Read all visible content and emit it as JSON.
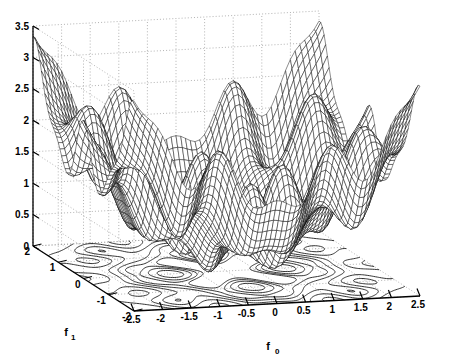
{
  "chart_data": {
    "type": "line",
    "render": "surface-mesh-3d-with-contour",
    "title": "",
    "subtitle": "",
    "xlabel": "f_0",
    "ylabel": "f_1",
    "zlabel": "",
    "axes": {
      "x": {
        "label": "f",
        "label_sub": "0",
        "min": -2.5,
        "max": 2.5,
        "ticks": [
          -2.5,
          -2,
          -1.5,
          -1,
          -0.5,
          0,
          0.5,
          1,
          1.5,
          2,
          2.5
        ],
        "tick_labels": [
          "-2.5",
          "-2",
          "-1.5",
          "-1",
          "-0.5",
          "0",
          "0.5",
          "1",
          "1.5",
          "2",
          "2.5"
        ]
      },
      "y": {
        "label": "f",
        "label_sub": "1",
        "min": -2.0,
        "max": 2.0,
        "ticks": [
          2,
          1,
          0,
          -1,
          -2
        ],
        "tick_labels": [
          "2",
          "1",
          "0",
          "-1",
          "-2"
        ]
      },
      "z": {
        "label": "",
        "min": 0,
        "max": 3.5,
        "ticks": [
          0,
          0.5,
          1,
          1.5,
          2,
          2.5,
          3,
          3.5
        ],
        "tick_labels": [
          "0",
          "0.5",
          "1",
          "1.5",
          "2",
          "2.5",
          "3",
          "3.5"
        ]
      }
    },
    "grid": true,
    "grid_style": "dotted",
    "legend": null,
    "colors": {
      "mesh": "#000000",
      "grid": "#999999",
      "axis": "#000000",
      "background": "#ffffff",
      "contour": "#000000"
    },
    "view": {
      "azimuth": -37.5,
      "elevation": 30
    },
    "surface": {
      "formula": "z = 0.25*(f0^2 + f1^2) + 0.5 - 0.5*cos(3.6*f0)*cos(3.6*f1) + 0.22*cos(6.3*f0) + 0.22*cos(6.3*f1)",
      "nx": 61,
      "ny": 61,
      "zrange": [
        0.0,
        3.5
      ]
    },
    "contour": {
      "levels": [
        0.55,
        0.75,
        1.0,
        1.35,
        1.8,
        2.3
      ],
      "plane_z": 0,
      "loop_count": 9
    }
  }
}
